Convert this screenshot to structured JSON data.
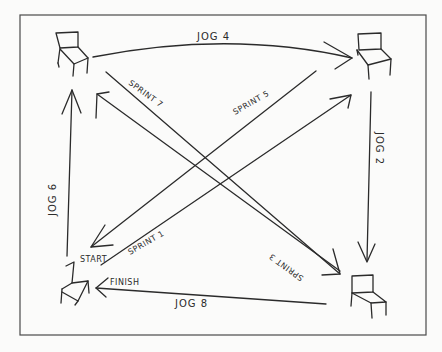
{
  "diagram": {
    "title": "",
    "nodes": [
      {
        "id": "chair-top-left",
        "label": ""
      },
      {
        "id": "chair-top-right",
        "label": ""
      },
      {
        "id": "chair-bottom-right",
        "label": ""
      },
      {
        "id": "chair-bottom-left",
        "labels": [
          "START",
          "FINISH"
        ]
      }
    ],
    "labels": {
      "start": "START",
      "finish": "FINISH",
      "jog4": "JOG 4",
      "jog2": "JOG 2",
      "jog8": "JOG 8",
      "jog6": "JOG 6",
      "sprint1": "SPRINT 1",
      "sprint3": "SPRINT 3",
      "sprint5": "SPRINT 5",
      "sprint7": "SPRINT 7"
    },
    "edges": [
      {
        "from": "chair-bottom-left",
        "to": "chair-top-right",
        "label": "SPRINT 1"
      },
      {
        "from": "chair-top-right",
        "to": "chair-bottom-right",
        "label": "JOG 2"
      },
      {
        "from": "chair-top-left",
        "to": "chair-bottom-right",
        "label": "SPRINT 3"
      },
      {
        "from": "chair-top-left",
        "to": "chair-top-right",
        "label": "JOG 4"
      },
      {
        "from": "chair-top-right",
        "to": "chair-bottom-left",
        "label": "SPRINT 5"
      },
      {
        "from": "chair-bottom-left",
        "to": "chair-top-left",
        "label": "JOG 6"
      },
      {
        "from": "chair-bottom-right",
        "to": "chair-top-left",
        "label": "SPRINT 7"
      },
      {
        "from": "chair-bottom-right",
        "to": "chair-bottom-left",
        "label": "JOG 8"
      }
    ]
  }
}
